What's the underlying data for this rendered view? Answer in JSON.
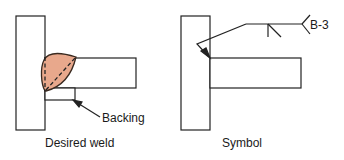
{
  "left_figure": {
    "caption": "Desired weld",
    "callout": "Backing",
    "weld_fill_color": "#e8a88c"
  },
  "right_figure": {
    "caption": "Symbol",
    "tail_reference": "B-3"
  }
}
